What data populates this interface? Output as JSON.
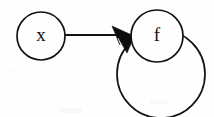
{
  "diagram": {
    "type": "directed-graph",
    "background_color": "#fefefe",
    "stroke_color": "#121212",
    "nodes": [
      {
        "id": "x",
        "label": "x",
        "cx": 41,
        "cy": 36,
        "r": 24
      },
      {
        "id": "f",
        "label": "f",
        "cx": 157,
        "cy": 36,
        "r": 26
      }
    ],
    "edges": [
      {
        "id": "x-to-f",
        "from": "x",
        "to": "f",
        "kind": "straight",
        "x1": 65,
        "y1": 35,
        "x2": 124,
        "y2": 35,
        "arrowhead": true
      },
      {
        "id": "f-self-loop",
        "from": "f",
        "to": "f",
        "kind": "self-loop",
        "cx": 161,
        "cy": 74,
        "r": 44,
        "arrowhead": true
      }
    ],
    "arrowheads": [
      {
        "id": "arrowhead-x-to-f",
        "for_edge": "x-to-f",
        "points": "113,27 133,36 117,38 120,46"
      },
      {
        "id": "arrowhead-self-loop",
        "for_edge": "f-self-loop",
        "points": "118,31 133,37 127,52 120,40"
      }
    ]
  }
}
